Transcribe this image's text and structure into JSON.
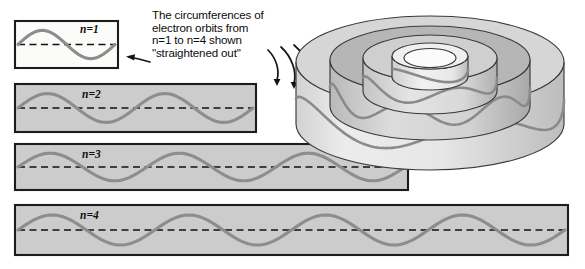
{
  "figure": {
    "caption_lines": [
      "The circumferences of",
      "electron orbits from",
      "n=1 to n=4  shown",
      "\"straightened out\""
    ],
    "caption_full": "The circumferences of electron orbits from n=1 to n=4 shown \"straightened out\"",
    "background_color": "#ffffff"
  },
  "colors": {
    "wave": "#8d8d8d",
    "panel_border": "#1c1c1c",
    "panel_fill_white": "#fbfbfa",
    "panel_fill_gray": "#cccccc",
    "dash_line": "#111111",
    "arrow": "#141414",
    "cylinder_light": "#e2e2e2",
    "cylinder_mid": "#c9c9c9",
    "cylinder_dark": "#a8a8a8",
    "cylinder_outline": "#3a3a3a"
  },
  "panels": [
    {
      "id": "panel-n1",
      "label": "n=1",
      "n": 1,
      "cycles": 1,
      "fill": "#fbfbfa",
      "x": 15,
      "y": 21,
      "width": 103,
      "height": 47,
      "label_x": 80,
      "label_y": 33
    },
    {
      "id": "panel-n2",
      "label": "n=2",
      "n": 2,
      "cycles": 2,
      "fill": "#cccccc",
      "x": 15,
      "y": 84,
      "width": 241,
      "height": 48,
      "label_x": 82,
      "label_y": 98
    },
    {
      "id": "panel-n3",
      "label": "n=3",
      "n": 3,
      "cycles": 3,
      "fill": "#cccccc",
      "x": 15,
      "y": 144,
      "width": 393,
      "height": 46,
      "label_x": 82,
      "label_y": 158
    },
    {
      "id": "panel-n4",
      "label": "n=4",
      "n": 4,
      "cycles": 4,
      "fill": "#cccccc",
      "x": 15,
      "y": 205,
      "width": 553,
      "height": 50,
      "label_x": 80,
      "label_y": 219
    }
  ],
  "caption": {
    "x": 152,
    "y": 19,
    "line_height": 12.6
  },
  "arrows": {
    "to_panel_label": "arrow pointing left to n=1 panel",
    "to_cylinder_label": "three curved arrows pointing toward lower panels and cylinder diagram",
    "count_curved": 3
  },
  "cylinder": {
    "label": "nested concentric electron orbit cylinders with standing waves",
    "rings": 4,
    "center_x": 430,
    "center_y": 62,
    "wave_cycles_outer": 2
  },
  "chart_data": {
    "type": "line",
    "xlabel": "",
    "ylabel": "",
    "series": [
      {
        "name": "n=1",
        "cycles": 1,
        "amplitude": 1,
        "panel_width": 103
      },
      {
        "name": "n=2",
        "cycles": 2,
        "amplitude": 1,
        "panel_width": 241
      },
      {
        "name": "n=3",
        "cycles": 3,
        "amplitude": 1,
        "panel_width": 393
      },
      {
        "name": "n=4",
        "cycles": 4,
        "amplitude": 1,
        "panel_width": 553
      }
    ]
  }
}
